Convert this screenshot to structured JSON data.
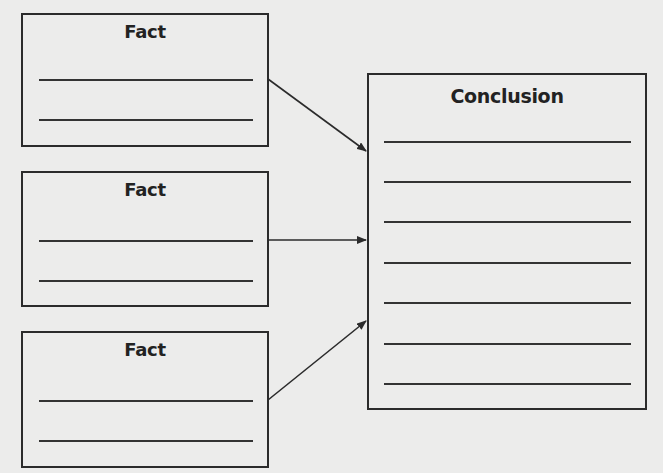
{
  "diagram": {
    "facts": [
      {
        "title": "Fact",
        "lines": 2
      },
      {
        "title": "Fact",
        "lines": 2
      },
      {
        "title": "Fact",
        "lines": 2
      }
    ],
    "conclusion": {
      "title": "Conclusion",
      "lines": 7
    },
    "arrows": [
      {
        "from": "fact-1",
        "to": "conclusion",
        "x1": 268,
        "y1": 79,
        "x2": 366,
        "y2": 151
      },
      {
        "from": "fact-2",
        "to": "conclusion",
        "x1": 268,
        "y1": 240,
        "x2": 366,
        "y2": 240
      },
      {
        "from": "fact-3",
        "to": "conclusion",
        "x1": 268,
        "y1": 400,
        "x2": 366,
        "y2": 321
      }
    ],
    "colors": {
      "background": "#ececeb",
      "stroke": "#2b2b2b",
      "text": "#222222"
    }
  }
}
